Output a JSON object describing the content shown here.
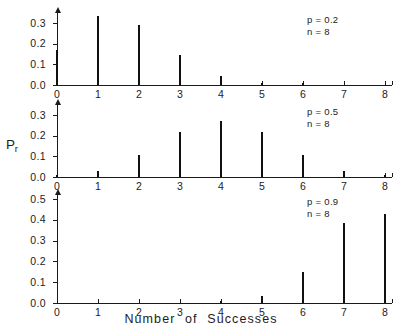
{
  "figure": {
    "ylabel": "Pr",
    "ylabel_main": "P",
    "ylabel_sub": "r",
    "xlabel": "Number  of  Successes"
  },
  "chart_data": [
    {
      "type": "bar",
      "title": "",
      "panel": "top",
      "annotation_p": "p = 0.2",
      "annotation_n": "n = 8",
      "p": 0.2,
      "n": 8,
      "categories": [
        "0",
        "1",
        "2",
        "3",
        "4",
        "5",
        "6",
        "7",
        "8"
      ],
      "x": [
        0,
        1,
        2,
        3,
        4,
        5,
        6,
        7,
        8
      ],
      "values": [
        0.168,
        0.336,
        0.294,
        0.147,
        0.046,
        0.009,
        0.001,
        0.0,
        0.0
      ],
      "xlabel": "Number of Successes",
      "ylabel": "Pr",
      "ylim": [
        0.0,
        0.35
      ],
      "xlim": [
        0,
        8
      ],
      "yticks": [
        0.0,
        0.1,
        0.2,
        0.3
      ],
      "ytick_labels": [
        "0.0",
        "0.1",
        "0.2",
        "0.3"
      ],
      "grid": false,
      "legend": "none"
    },
    {
      "type": "bar",
      "title": "",
      "panel": "middle",
      "annotation_p": "p = 0.5",
      "annotation_n": "n = 8",
      "p": 0.5,
      "n": 8,
      "categories": [
        "0",
        "1",
        "2",
        "3",
        "4",
        "5",
        "6",
        "7",
        "8"
      ],
      "x": [
        0,
        1,
        2,
        3,
        4,
        5,
        6,
        7,
        8
      ],
      "values": [
        0.004,
        0.031,
        0.109,
        0.219,
        0.273,
        0.219,
        0.109,
        0.031,
        0.004
      ],
      "xlabel": "Number of Successes",
      "ylabel": "Pr",
      "ylim": [
        0.0,
        0.35
      ],
      "xlim": [
        0,
        8
      ],
      "yticks": [
        0.0,
        0.1,
        0.2,
        0.3
      ],
      "ytick_labels": [
        "0.0",
        "0.1",
        "0.2",
        "0.3"
      ],
      "grid": false,
      "legend": "none"
    },
    {
      "type": "bar",
      "title": "",
      "panel": "bottom",
      "annotation_p": "p = 0.9",
      "annotation_n": "n = 8",
      "p": 0.9,
      "n": 8,
      "categories": [
        "0",
        "1",
        "2",
        "3",
        "4",
        "5",
        "6",
        "7",
        "8"
      ],
      "x": [
        0,
        1,
        2,
        3,
        4,
        5,
        6,
        7,
        8
      ],
      "values": [
        0.0,
        0.0,
        0.0,
        0.0,
        0.005,
        0.033,
        0.149,
        0.383,
        0.43
      ],
      "xlabel": "Number of Successes",
      "ylabel": "Pr",
      "ylim": [
        0.0,
        0.52
      ],
      "xlim": [
        0,
        8
      ],
      "yticks": [
        0.0,
        0.1,
        0.2,
        0.3,
        0.4,
        0.5
      ],
      "ytick_labels": [
        "0.0",
        "0.1",
        "0.2",
        "0.3",
        "0.4",
        "0.5"
      ],
      "grid": false,
      "legend": "none"
    }
  ],
  "style": {
    "axis_color": "#1a1a1a",
    "bar_color": "#111111",
    "background": "#ffffff"
  }
}
